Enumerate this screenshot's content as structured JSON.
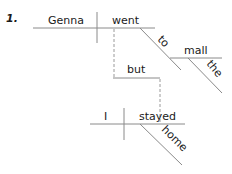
{
  "diagram": {
    "item_number": "1.",
    "sentence_parts": {
      "clause1": {
        "subject": "Genna",
        "verb": "went",
        "preposition": "to",
        "object": "mall",
        "article": "the"
      },
      "conjunction": "but",
      "clause2": {
        "subject": "I",
        "verb": "stayed",
        "adverb": "home"
      }
    },
    "colors": {
      "line": "#8a8a8a",
      "text": "#1a1a1a",
      "background": "#ffffff"
    }
  }
}
